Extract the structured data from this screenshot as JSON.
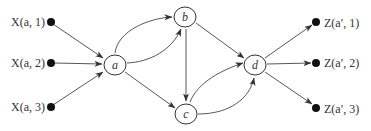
{
  "diagram": {
    "type": "directed-graph",
    "nodes": {
      "a": {
        "label": "a",
        "x": 115,
        "y": 65
      },
      "b": {
        "label": "b",
        "x": 185,
        "y": 17
      },
      "c": {
        "label": "c",
        "x": 186,
        "y": 114
      },
      "d": {
        "label": "d",
        "x": 255,
        "y": 65
      }
    },
    "inputs": [
      {
        "label": "X(a, 1)",
        "x": 51,
        "y": 22
      },
      {
        "label": "X(a, 2)",
        "x": 51,
        "y": 63
      },
      {
        "label": "X(a, 3)",
        "x": 51,
        "y": 107
      }
    ],
    "outputs": [
      {
        "label": "Z(a′, 1)",
        "x": 316,
        "y": 22
      },
      {
        "label": "Z(a′, 2)",
        "x": 316,
        "y": 63
      },
      {
        "label": "Z(a′, 3)",
        "x": 316,
        "y": 108
      }
    ],
    "edges": [
      {
        "from": "X(a, 1)",
        "to": "a"
      },
      {
        "from": "X(a, 2)",
        "to": "a"
      },
      {
        "from": "X(a, 3)",
        "to": "a"
      },
      {
        "from": "a",
        "to": "b",
        "style": "curved-upper"
      },
      {
        "from": "a",
        "to": "b",
        "style": "curved-lower"
      },
      {
        "from": "a",
        "to": "c"
      },
      {
        "from": "b",
        "to": "c"
      },
      {
        "from": "b",
        "to": "d"
      },
      {
        "from": "c",
        "to": "d",
        "style": "curved-upper"
      },
      {
        "from": "c",
        "to": "d",
        "style": "curved-lower"
      },
      {
        "from": "d",
        "to": "Z(a′, 1)"
      },
      {
        "from": "d",
        "to": "Z(a′, 2)"
      },
      {
        "from": "d",
        "to": "Z(a′, 3)"
      }
    ]
  }
}
